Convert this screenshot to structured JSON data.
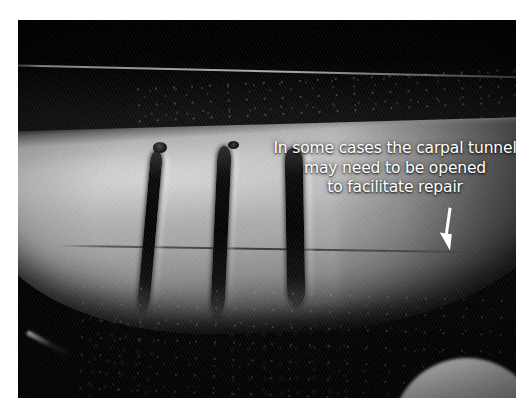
{
  "slide": {
    "kind": "surgical-photograph-slide",
    "background_color": "#ffffff"
  },
  "photo": {
    "subject": "forearm-wrist-with-transverse-lacerations",
    "description": "Black-and-white clinical photograph of a forearm near the wrist showing three transverse lacerations, with surgical drapes above and below",
    "border_color": "#ffffff",
    "dark_field_color": "#050505",
    "skin_tone_color": "#b4b4b4"
  },
  "caption": {
    "lines": [
      "In some cases the carpal tunnel",
      "may need to be opened",
      "to facilitate repair"
    ],
    "full_text": "In some cases the carpal tunnel may need to be opened to facilitate repair",
    "color": "#ffffff",
    "align": "center"
  },
  "annotation": {
    "arrow": {
      "name": "down-arrow",
      "color": "#ffffff",
      "direction": "down",
      "points_to": "carpal tunnel region"
    }
  },
  "features": {
    "lacerations": [
      {
        "label": "laceration-1"
      },
      {
        "label": "laceration-2"
      },
      {
        "label": "laceration-3"
      }
    ],
    "crease_label": "transverse-wrist-crease"
  }
}
